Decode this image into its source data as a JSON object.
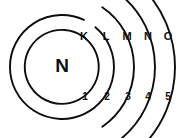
{
  "diagram": {
    "type": "atomic-shell-diagram",
    "nucleus": {
      "label": "N",
      "name": "nucleus"
    },
    "stroke_color": "#0d0d0d",
    "background_color": "#ffffff",
    "text_color": "#111111",
    "center": {
      "x": 62,
      "y": 67
    },
    "shells": [
      {
        "letter": "K",
        "number": "1",
        "radius": 37,
        "letter_pos": {
          "x": 84,
          "y": 37
        },
        "number_pos": {
          "x": 85,
          "y": 97
        },
        "arc_start_deg": -57,
        "arc_end_deg": 302
      },
      {
        "letter": "L",
        "number": "2",
        "radius": 52,
        "letter_pos": {
          "x": 106,
          "y": 37
        },
        "number_pos": {
          "x": 107,
          "y": 97
        },
        "arc_start_deg": -50,
        "arc_end_deg": 295
      },
      {
        "letter": "M",
        "number": "3",
        "radius": 72,
        "letter_pos": {
          "x": 127,
          "y": 37
        },
        "number_pos": {
          "x": 128,
          "y": 97
        },
        "arc_start_deg": -56,
        "arc_end_deg": 56
      },
      {
        "letter": "N",
        "number": "4",
        "radius": 93,
        "letter_pos": {
          "x": 148,
          "y": 37
        },
        "number_pos": {
          "x": 148,
          "y": 97
        },
        "arc_start_deg": -50,
        "arc_end_deg": 50
      },
      {
        "letter": "O",
        "number": "5",
        "radius": 113,
        "letter_pos": {
          "x": 168,
          "y": 37
        },
        "number_pos": {
          "x": 168,
          "y": 97
        },
        "arc_start_deg": -44,
        "arc_end_deg": 44
      }
    ]
  }
}
